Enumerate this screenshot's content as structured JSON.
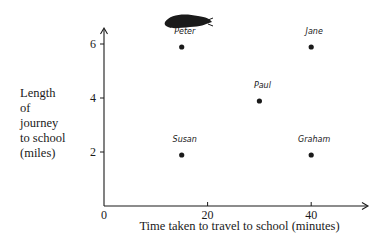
{
  "chart_data": {
    "type": "scatter",
    "title": "",
    "xlabel": "Time taken to travel to school (minutes)",
    "ylabel": "Length\nof\njourney\nto school\n(miles)",
    "xlim": [
      0,
      50
    ],
    "ylim": [
      0,
      6.5
    ],
    "x_ticks": [
      0,
      20,
      40
    ],
    "y_ticks": [
      2,
      4,
      6
    ],
    "grid": false,
    "legend": null,
    "points": [
      {
        "label": "Peter",
        "x": 15,
        "y": 6
      },
      {
        "label": "Jane",
        "x": 40,
        "y": 6
      },
      {
        "label": "Paul",
        "x": 30,
        "y": 4
      },
      {
        "label": "Susan",
        "x": 15,
        "y": 2
      },
      {
        "label": "Graham",
        "x": 40,
        "y": 2
      }
    ],
    "annotations": [
      "Scribbled-out mark above Peter's label"
    ]
  },
  "colors": {
    "ink": "#1a1a1a",
    "background": "#ffffff"
  }
}
